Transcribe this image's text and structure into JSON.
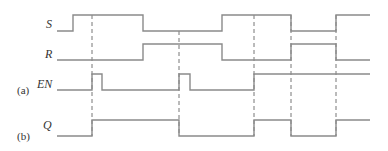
{
  "labels": {
    "S": "S",
    "R": "R",
    "EN": "EN",
    "Q": "Q",
    "part_a": "(a)",
    "part_b": "(b)"
  },
  "colors": {
    "signal": "#8a8a8a",
    "dashed": "#777777",
    "text": "#333333"
  },
  "signals": {
    "S": "57,31 73,31 73,15 143,15 143,31 222,31 222,15 291,15 291,31 336,31 336,15 370,15",
    "R": "57,60 143,60 143,44 222,44 222,60 291,60 291,44 336,44 336,60 370,60",
    "EN": "57,90 92,90 92,74 102,74 102,90 179,90 179,74 190,74 190,90 254,90 254,74 370,74",
    "Q": "57,136 92,136 92,120 179,120 179,136 254,136 254,120 291,120 291,136 336,136 336,120 370,120"
  },
  "dashed_lines": [
    {
      "x": 92,
      "y1": 15,
      "y2": 136
    },
    {
      "x": 179,
      "y1": 31,
      "y2": 136
    },
    {
      "x": 254,
      "y1": 15,
      "y2": 136
    },
    {
      "x": 291,
      "y1": 15,
      "y2": 136
    },
    {
      "x": 336,
      "y1": 15,
      "y2": 136
    }
  ]
}
